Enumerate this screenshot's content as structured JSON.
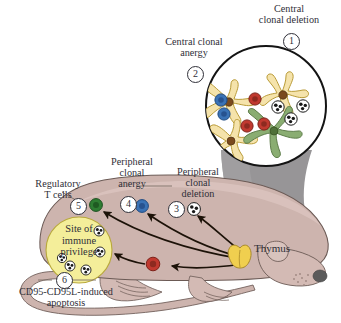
{
  "figure": {
    "type": "biological-schematic"
  },
  "labels": {
    "central_clonal_deletion": "Central\nclonal deletion",
    "central_clonal_deletion_line1": "Central",
    "central_clonal_deletion_line2": "clonal deletion",
    "central_clonal_anergy_line1": "Central clonal",
    "central_clonal_anergy_line2": "anergy",
    "peripheral_clonal_anergy_line1": "Peripheral",
    "peripheral_clonal_anergy_line2": "clonal",
    "peripheral_clonal_anergy_line3": "anergy",
    "peripheral_clonal_deletion_line1": "Peripheral",
    "peripheral_clonal_deletion_line2": "clonal",
    "peripheral_clonal_deletion_line3": "deletion",
    "regulatory_t_cells_line1": "Regulatory",
    "regulatory_t_cells_line2": "T cells",
    "site_of_immune_privilege_line1": "Site of",
    "site_of_immune_privilege_line2": "immune",
    "site_of_immune_privilege_line3": "privilege",
    "apoptosis_line1": "CD95-CD95L-induced",
    "apoptosis_line2": "apoptosis",
    "thymus": "Thymus"
  },
  "callouts": [
    {
      "number": "1",
      "label": "Central clonal deletion"
    },
    {
      "number": "2",
      "label": "Central clonal anergy"
    },
    {
      "number": "3",
      "label": "Peripheral clonal deletion"
    },
    {
      "number": "4",
      "label": "Peripheral clonal anergy"
    },
    {
      "number": "5",
      "label": "Regulatory T cells"
    },
    {
      "number": "6",
      "label": "CD95-CD95L-induced apoptosis"
    }
  ],
  "colors": {
    "mouse_body": "#cdb4ae",
    "mouse_body_light": "#d8c3bd",
    "mouse_outline": "#6b5a55",
    "cone_shadow": "#8c8a8c",
    "inset_fill": "#ffffff",
    "inset_outline": "#1a1a1a",
    "epithelial_cell": "#f5e3ab",
    "epithelial_outline": "#b99b38",
    "dendritic_cell": "#8aad72",
    "dendritic_outline": "#5e7d4a",
    "t_cell_blue": "#3a72b5",
    "t_cell_red": "#c0392f",
    "t_cell_green": "#2e7d32",
    "apoptotic_cell": "#ffffff",
    "nucleus_brown": "#7a4a1e",
    "thymus": "#f0cf4f",
    "thymus_outline": "#a8892a",
    "text": "#2f2f38",
    "arrow": "#1c1208",
    "nose": "#5a5a5a"
  },
  "cells": {
    "inset_t_blue_count": 2,
    "inset_t_red_count": 3,
    "inset_apoptotic_count": 3,
    "inset_epithelial_count": 3,
    "inset_dendritic_count": 1,
    "privilege_apoptotic_count": 5
  },
  "body_markers": [
    {
      "name": "regulatory-t-cell-marker",
      "color": "#2e7d32"
    },
    {
      "name": "anergic-t-cell-marker",
      "color": "#3a72b5"
    },
    {
      "name": "deleted-t-cell-marker",
      "color": "#ffffff"
    },
    {
      "name": "apoptotic-t-cell-marker",
      "color": "#c0392f"
    }
  ]
}
